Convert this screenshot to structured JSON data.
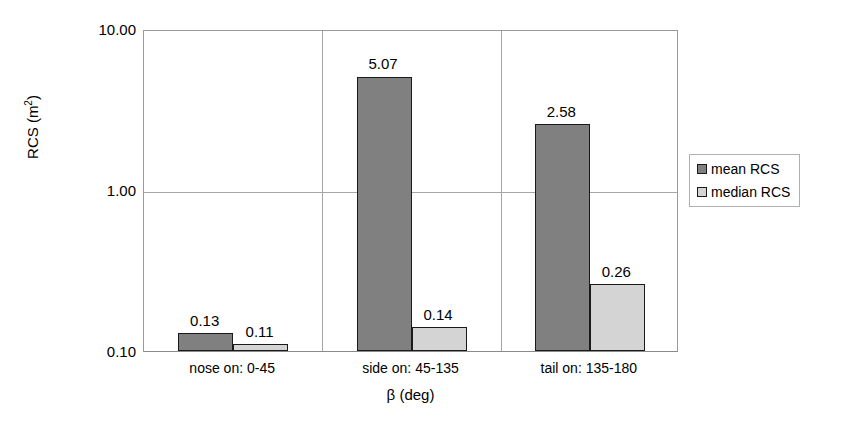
{
  "chart_data": {
    "type": "bar",
    "title": "",
    "xlabel": "β (deg)",
    "ylabel": "RCS (m²)",
    "ylabel_base": "RCS (m",
    "ylabel_sup": "2",
    "ylabel_close": ")",
    "yscale": "log",
    "ylim": [
      0.1,
      10.0
    ],
    "ytick_labels": [
      "10.00",
      "1.00",
      "0.10"
    ],
    "ytick_values": [
      10.0,
      1.0,
      0.1
    ],
    "grid": true,
    "legend_position": "right",
    "categories": [
      "nose on:  0-45",
      "side on: 45-135",
      "tail on: 135-180"
    ],
    "series": [
      {
        "name": "mean RCS",
        "color": "#808080",
        "values": [
          0.13,
          5.07,
          2.58
        ],
        "labels": [
          "0.13",
          "5.07",
          "2.58"
        ]
      },
      {
        "name": "median RCS",
        "color": "#d4d4d4",
        "values": [
          0.11,
          0.14,
          0.26
        ],
        "labels": [
          "0.11",
          "0.14",
          "0.26"
        ]
      }
    ]
  },
  "legend": {
    "items": [
      {
        "label": "mean RCS",
        "color": "#808080"
      },
      {
        "label": "median RCS",
        "color": "#d4d4d4"
      }
    ]
  },
  "axes": {
    "y_ticks": [
      {
        "label": "10.00"
      },
      {
        "label": "1.00"
      },
      {
        "label": "0.10"
      }
    ],
    "x_categories": [
      {
        "label": "nose on:  0-45"
      },
      {
        "label": "side on: 45-135"
      },
      {
        "label": "tail on: 135-180"
      }
    ],
    "x_title": "β (deg)",
    "y_title_base": "RCS (m",
    "y_title_sup": "2",
    "y_title_close": ")"
  }
}
